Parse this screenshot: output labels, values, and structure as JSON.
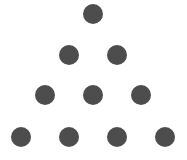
{
  "diagram": {
    "type": "dot-triangle",
    "dot_color": "#4d4d4d",
    "dot_radius": 10,
    "rows": [
      {
        "count": 1,
        "y": 14,
        "xs": [
          93
        ]
      },
      {
        "count": 2,
        "y": 55,
        "xs": [
          69,
          117
        ]
      },
      {
        "count": 3,
        "y": 95,
        "xs": [
          45,
          93,
          141
        ]
      },
      {
        "count": 4,
        "y": 137,
        "xs": [
          21,
          69,
          117,
          165
        ]
      }
    ],
    "total_dots": 10
  }
}
